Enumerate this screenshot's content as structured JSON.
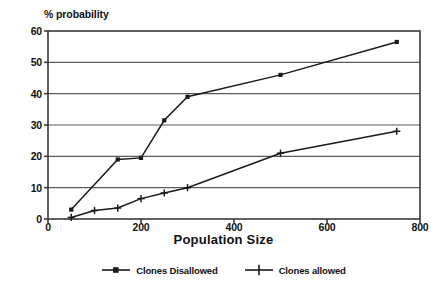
{
  "chart_data": {
    "type": "line",
    "title": "",
    "xlabel": "Population Size",
    "ylabel": "% probability",
    "xlim": [
      0,
      800
    ],
    "ylim": [
      0,
      60
    ],
    "xticks": [
      "0",
      "200",
      "400",
      "600",
      "800"
    ],
    "xtick_values": [
      0,
      200,
      400,
      600,
      800
    ],
    "yticks": [
      "0",
      "10",
      "20",
      "30",
      "40",
      "50",
      "60"
    ],
    "ytick_values": [
      0,
      10,
      20,
      30,
      40,
      50,
      60
    ],
    "grid": "horizontal",
    "legend_position": "bottom",
    "series": [
      {
        "name": "Clones Disallowed",
        "marker": "square",
        "color": "#1a1a1a",
        "x": [
          50,
          150,
          200,
          250,
          300,
          500,
          750
        ],
        "values": [
          3,
          19,
          19.5,
          31.5,
          39,
          46,
          56.5
        ]
      },
      {
        "name": "Clones allowed",
        "marker": "plus",
        "color": "#1a1a1a",
        "x": [
          50,
          100,
          150,
          200,
          250,
          300,
          500,
          750
        ],
        "values": [
          0.5,
          2.7,
          3.5,
          6.5,
          8.3,
          10,
          21,
          28
        ]
      }
    ]
  },
  "legend": {
    "entries": [
      {
        "label": "Clones Disallowed",
        "marker": "square-marker-icon"
      },
      {
        "label": "Clones allowed",
        "marker": "plus-marker-icon"
      }
    ]
  },
  "axis": {
    "y_title": "% probability",
    "x_title": "Population Size"
  }
}
